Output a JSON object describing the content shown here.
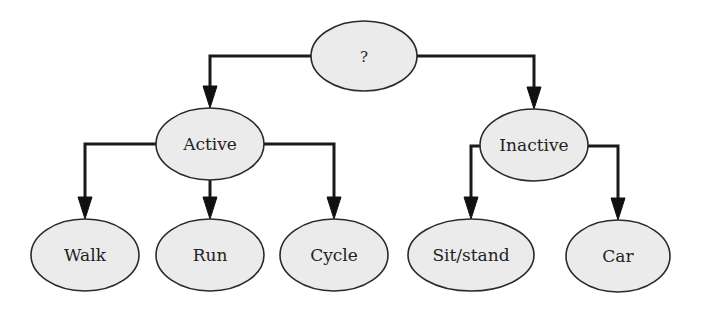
{
  "diagram": {
    "type": "tree",
    "colors": {
      "node_fill": "#ebebeb",
      "node_stroke": "#2a2a2a",
      "edge": "#1a1a1a",
      "text": "#222222",
      "background": "#ffffff"
    },
    "nodes": {
      "root": {
        "label": "?",
        "cx": 364,
        "cy": 56,
        "rx": 53,
        "ry": 35
      },
      "active": {
        "label": "Active",
        "cx": 210,
        "cy": 144,
        "rx": 54,
        "ry": 36
      },
      "inactive": {
        "label": "Inactive",
        "cx": 534,
        "cy": 145,
        "rx": 54,
        "ry": 36
      },
      "walk": {
        "label": "Walk",
        "cx": 85,
        "cy": 255,
        "rx": 54,
        "ry": 36
      },
      "run": {
        "label": "Run",
        "cx": 210,
        "cy": 255,
        "rx": 54,
        "ry": 36
      },
      "cycle": {
        "label": "Cycle",
        "cx": 334,
        "cy": 255,
        "rx": 54,
        "ry": 36
      },
      "sitstand": {
        "label": "Sit/stand",
        "cx": 471,
        "cy": 255,
        "rx": 63,
        "ry": 36
      },
      "car": {
        "label": "Car",
        "cx": 618,
        "cy": 256,
        "rx": 52,
        "ry": 36
      }
    },
    "edges": [
      {
        "from": "root",
        "to": "active"
      },
      {
        "from": "root",
        "to": "inactive"
      },
      {
        "from": "active",
        "to": "walk"
      },
      {
        "from": "active",
        "to": "run"
      },
      {
        "from": "active",
        "to": "cycle"
      },
      {
        "from": "inactive",
        "to": "sitstand"
      },
      {
        "from": "inactive",
        "to": "car"
      }
    ]
  }
}
